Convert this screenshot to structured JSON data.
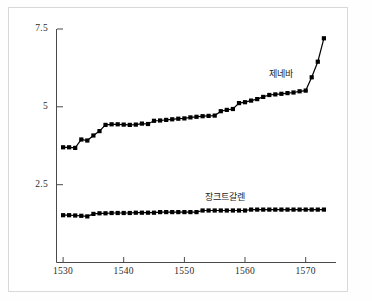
{
  "chart_data": {
    "type": "line",
    "title": "",
    "xlabel": "",
    "ylabel": "",
    "xlim": [
      1529,
      1575
    ],
    "ylim": [
      0,
      7.5
    ],
    "grid": false,
    "legend_position": "inline-annotation",
    "xticks": [
      1530,
      1540,
      1550,
      1560,
      1570
    ],
    "xticklabels": [
      "1530",
      "1540",
      "1550",
      "1560",
      "1570"
    ],
    "yticks": [
      2.5,
      5,
      7.5
    ],
    "yticklabels": [
      "2.5",
      "5",
      "7.5"
    ],
    "marker": "square-filled",
    "series": [
      {
        "name": "제네바",
        "label": "제네바",
        "color": "#000000",
        "x": [
          1530,
          1531,
          1532,
          1533,
          1534,
          1535,
          1536,
          1537,
          1538,
          1539,
          1540,
          1541,
          1542,
          1543,
          1544,
          1545,
          1546,
          1547,
          1548,
          1549,
          1550,
          1551,
          1552,
          1553,
          1554,
          1555,
          1556,
          1557,
          1558,
          1559,
          1560,
          1561,
          1562,
          1563,
          1564,
          1565,
          1566,
          1567,
          1568,
          1569,
          1570,
          1571,
          1572,
          1573
        ],
        "values": [
          3.7,
          3.7,
          3.68,
          3.95,
          3.92,
          4.08,
          4.22,
          4.42,
          4.44,
          4.44,
          4.43,
          4.42,
          4.43,
          4.46,
          4.45,
          4.55,
          4.56,
          4.58,
          4.6,
          4.62,
          4.63,
          4.66,
          4.68,
          4.7,
          4.71,
          4.72,
          4.86,
          4.9,
          4.93,
          5.12,
          5.15,
          5.2,
          5.25,
          5.32,
          5.38,
          5.4,
          5.42,
          5.44,
          5.46,
          5.5,
          5.52,
          5.95,
          6.45,
          7.2
        ]
      },
      {
        "name": "장크트갈렌",
        "label": "장크트갈렌",
        "color": "#000000",
        "x": [
          1530,
          1531,
          1532,
          1533,
          1534,
          1535,
          1536,
          1537,
          1538,
          1539,
          1540,
          1541,
          1542,
          1543,
          1544,
          1545,
          1546,
          1547,
          1548,
          1549,
          1550,
          1551,
          1552,
          1553,
          1554,
          1555,
          1556,
          1557,
          1558,
          1559,
          1560,
          1561,
          1562,
          1563,
          1564,
          1565,
          1566,
          1567,
          1568,
          1569,
          1570,
          1571,
          1572,
          1573
        ],
        "values": [
          1.52,
          1.52,
          1.51,
          1.5,
          1.48,
          1.56,
          1.58,
          1.58,
          1.59,
          1.59,
          1.59,
          1.59,
          1.6,
          1.6,
          1.6,
          1.6,
          1.62,
          1.62,
          1.62,
          1.62,
          1.62,
          1.62,
          1.62,
          1.67,
          1.67,
          1.67,
          1.67,
          1.67,
          1.67,
          1.67,
          1.67,
          1.7,
          1.7,
          1.7,
          1.7,
          1.7,
          1.7,
          1.7,
          1.7,
          1.7,
          1.7,
          1.7,
          1.7,
          1.7
        ]
      }
    ],
    "annotations": [
      {
        "text": "제네바",
        "x": 1567,
        "y": 6.1
      },
      {
        "text": "장크트갈렌",
        "x": 1558,
        "y": 2.15
      }
    ]
  }
}
